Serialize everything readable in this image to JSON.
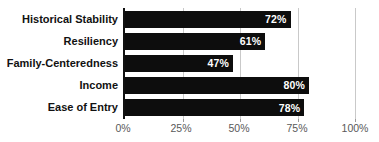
{
  "chart_data": {
    "type": "bar",
    "orientation": "horizontal",
    "title": "",
    "xlabel": "",
    "ylabel": "",
    "categories": [
      "Historical Stability",
      "Resiliency",
      "Family-Centeredness",
      "Income",
      "Ease of Entry"
    ],
    "values": [
      72,
      61,
      47,
      80,
      78
    ],
    "value_labels": [
      "72%",
      "61%",
      "47%",
      "80%",
      "78%"
    ],
    "x_ticks": [
      "0%",
      "25%",
      "50%",
      "75%",
      "100%"
    ],
    "x_tick_values": [
      0,
      25,
      50,
      75,
      100
    ],
    "xlim": [
      0,
      100
    ],
    "grid": "vertical-gridlines",
    "legend": "none",
    "colors": {
      "bar": "#0d0d0d",
      "bar_value_label": "#ffffff",
      "category_label": "#111111",
      "tick_label": "#595959",
      "gridline": "#c9c9c9",
      "axis_line": "#111111",
      "background": "#ffffff"
    }
  }
}
